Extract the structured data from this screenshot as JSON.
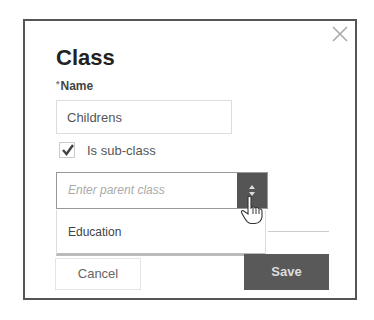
{
  "dialog": {
    "title": "Class",
    "name_label": "Name",
    "required_marker": "*",
    "name_value": "Childrens",
    "subclass_checkbox": {
      "label": "Is sub-class",
      "checked": true
    },
    "parent_select": {
      "placeholder": "Enter parent class",
      "options": [
        "Education"
      ]
    },
    "buttons": {
      "cancel": "Cancel",
      "save": "Save"
    },
    "close_icon": "close-icon"
  },
  "colors": {
    "save_bg": "#595959",
    "border": "#555555"
  }
}
